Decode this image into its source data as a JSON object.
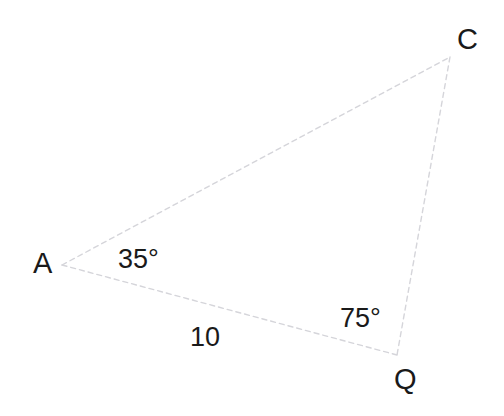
{
  "figure": {
    "type": "triangle-diagram",
    "background_color": "#ffffff",
    "line_color": "#d5d5da",
    "text_color": "#1a1a1a",
    "width": 504,
    "height": 416,
    "vertices": [
      {
        "name": "A",
        "label": "A",
        "x": 62,
        "y": 265
      },
      {
        "name": "C",
        "label": "C",
        "x": 450,
        "y": 57
      },
      {
        "name": "Q",
        "label": "Q",
        "x": 397,
        "y": 355
      }
    ],
    "sides": [
      {
        "name": "AC",
        "from": "A",
        "to": "C",
        "style": "dashed",
        "label": ""
      },
      {
        "name": "CQ",
        "from": "C",
        "to": "Q",
        "style": "dashed",
        "label": ""
      },
      {
        "name": "AQ",
        "from": "A",
        "to": "Q",
        "style": "dashed",
        "label": "10"
      }
    ],
    "angles": [
      {
        "at": "A",
        "label": "35°",
        "value": 35
      },
      {
        "at": "Q",
        "label": "75°",
        "value": 75
      }
    ],
    "labels": {
      "vertex_a": "A",
      "vertex_c": "C",
      "vertex_q": "Q",
      "angle_at_a": "35°",
      "angle_at_q": "75°",
      "side_aq_length": "10"
    }
  }
}
